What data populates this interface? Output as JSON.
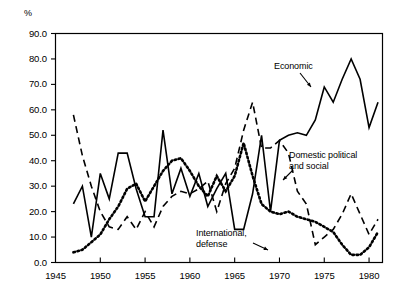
{
  "axis": {
    "unit_label": "%",
    "y_ticks": [
      "0.0",
      "10.0",
      "20.0",
      "30.0",
      "40.0",
      "50.0",
      "60.0",
      "70.0",
      "80.0",
      "90.0"
    ],
    "x_ticks": [
      "1945",
      "1950",
      "1955",
      "1960",
      "1965",
      "1970",
      "1975",
      "1980"
    ]
  },
  "annotations": {
    "economic": "Economic",
    "domestic_line1": "Domestic political",
    "domestic_line2": "and social",
    "international_line1": "International,",
    "international_line2": "defense"
  },
  "chart_data": {
    "type": "line",
    "title": "",
    "xlabel": "",
    "ylabel": "%",
    "xlim": [
      1945,
      1981.5
    ],
    "ylim": [
      0,
      90
    ],
    "ytick_step": 10,
    "xtick_step": 5,
    "grid": false,
    "legend": "inline-annotations",
    "series": [
      {
        "name": "Economic",
        "style": "solid",
        "color": "#000000",
        "x": [
          1947,
          1948,
          1949,
          1950,
          1951,
          1952,
          1953,
          1954,
          1955,
          1956,
          1957,
          1958,
          1959,
          1960,
          1961,
          1962,
          1963,
          1964,
          1965,
          1966,
          1967,
          1968,
          1969,
          1970,
          1971,
          1972,
          1973,
          1974,
          1975,
          1976,
          1977,
          1978,
          1979,
          1980,
          1981
        ],
        "values": [
          23,
          30,
          10,
          35,
          25,
          43,
          43,
          29,
          18,
          18,
          52,
          27,
          37,
          26,
          35,
          22,
          29,
          35,
          13,
          13,
          27,
          50,
          20,
          48,
          50,
          51,
          50,
          56,
          69,
          63,
          72,
          80,
          72,
          53,
          63
        ]
      },
      {
        "name": "Domestic political and social",
        "style": "dashed",
        "color": "#000000",
        "x": [
          1947,
          1948,
          1949,
          1950,
          1951,
          1952,
          1953,
          1954,
          1955,
          1956,
          1957,
          1958,
          1959,
          1960,
          1961,
          1962,
          1963,
          1964,
          1965,
          1966,
          1967,
          1968,
          1969,
          1970,
          1971,
          1972,
          1973,
          1974,
          1975,
          1976,
          1977,
          1978,
          1979,
          1980,
          1981
        ],
        "values": [
          58,
          42,
          30,
          20,
          14,
          13,
          18,
          13,
          20,
          14,
          22,
          26,
          28,
          27,
          29,
          32,
          20,
          31,
          37,
          52,
          63,
          45,
          45,
          48,
          43,
          28,
          23,
          7,
          10,
          13,
          19,
          27,
          19,
          11,
          17
        ]
      },
      {
        "name": "International, defense",
        "style": "dotted",
        "color": "#000000",
        "x": [
          1947,
          1948,
          1949,
          1950,
          1951,
          1952,
          1953,
          1954,
          1955,
          1956,
          1957,
          1958,
          1959,
          1960,
          1961,
          1962,
          1963,
          1964,
          1965,
          1966,
          1967,
          1968,
          1969,
          1970,
          1971,
          1972,
          1973,
          1974,
          1975,
          1976,
          1977,
          1978,
          1979,
          1980,
          1981
        ],
        "values": [
          4,
          5,
          8,
          11,
          17,
          22,
          29,
          31,
          24,
          30,
          36,
          40,
          41,
          36,
          30,
          26,
          34,
          28,
          34,
          47,
          34,
          23,
          20,
          19,
          20,
          18,
          17,
          16,
          14,
          12,
          7,
          3,
          3,
          6,
          12
        ]
      }
    ]
  }
}
